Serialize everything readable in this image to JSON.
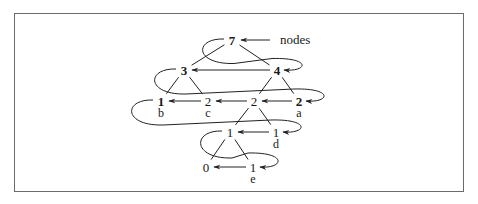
{
  "diagram": {
    "annotation": {
      "text": "nodes",
      "x": 280,
      "y": 44,
      "arrow_from": [
        270,
        40
      ],
      "arrow_to": [
        241,
        40
      ]
    },
    "nodes": [
      {
        "id": "n7",
        "value": "7",
        "bold": true,
        "x": 232,
        "y": 40,
        "label": ""
      },
      {
        "id": "n3",
        "value": "3",
        "bold": true,
        "x": 184,
        "y": 70,
        "label": ""
      },
      {
        "id": "n4",
        "value": "4",
        "bold": true,
        "x": 277,
        "y": 70,
        "label": ""
      },
      {
        "id": "nb",
        "value": "1",
        "bold": true,
        "x": 161,
        "y": 101,
        "label": "b"
      },
      {
        "id": "nc",
        "value": "2",
        "bold": false,
        "x": 208,
        "y": 101,
        "label": "c"
      },
      {
        "id": "nm",
        "value": "2",
        "bold": false,
        "x": 254,
        "y": 101,
        "label": ""
      },
      {
        "id": "na",
        "value": "2",
        "bold": true,
        "x": 299,
        "y": 101,
        "label": "a"
      },
      {
        "id": "nl",
        "value": "1",
        "bold": false,
        "x": 230,
        "y": 132,
        "label": ""
      },
      {
        "id": "nd",
        "value": "1",
        "bold": false,
        "x": 276,
        "y": 132,
        "label": "d"
      },
      {
        "id": "n0",
        "value": "0",
        "bold": false,
        "x": 206,
        "y": 167,
        "label": ""
      },
      {
        "id": "ne",
        "value": "1",
        "bold": false,
        "x": 253,
        "y": 167,
        "label": "e"
      }
    ],
    "tree_edges": [
      [
        "n7",
        "n3"
      ],
      [
        "n7",
        "n4"
      ],
      [
        "n3",
        "nb"
      ],
      [
        "n3",
        "nc"
      ],
      [
        "n4",
        "nm"
      ],
      [
        "n4",
        "na"
      ],
      [
        "nm",
        "nl"
      ],
      [
        "nm",
        "nd"
      ],
      [
        "nl",
        "n0"
      ],
      [
        "nl",
        "ne"
      ]
    ],
    "straight_links": [
      [
        "n4",
        "n3"
      ],
      [
        "nc",
        "nb"
      ],
      [
        "nm",
        "nc"
      ],
      [
        "na",
        "nm"
      ],
      [
        "nd",
        "nl"
      ],
      [
        "ne",
        "n0"
      ]
    ],
    "wrap_links": [
      [
        "n7",
        "n4"
      ],
      [
        "n3",
        "na"
      ],
      [
        "nb",
        "nd"
      ],
      [
        "nl",
        "ne"
      ]
    ]
  }
}
